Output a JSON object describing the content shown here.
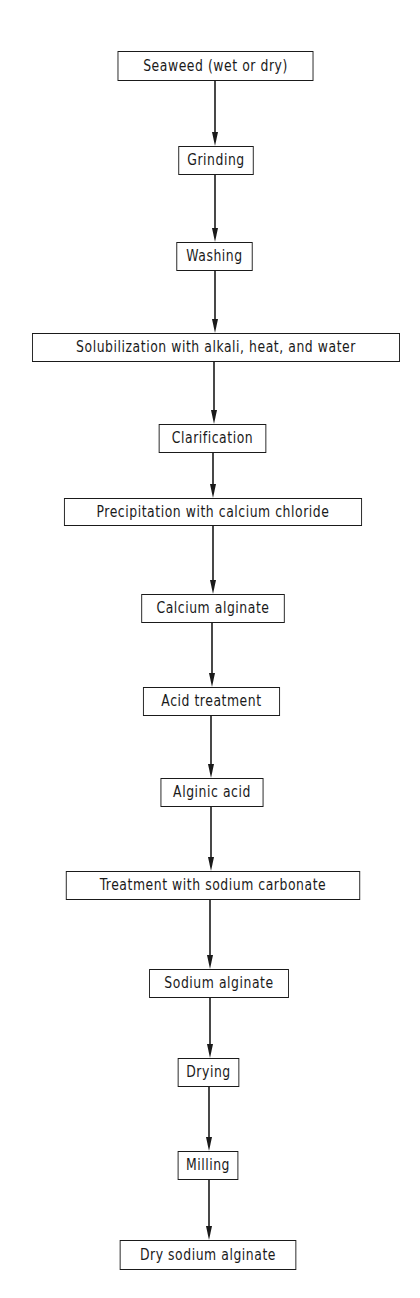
{
  "diagram": {
    "type": "flowchart",
    "direction": "top-to-bottom",
    "line_color": "#1a1a1a",
    "background": "#ffffff",
    "steps": [
      {
        "id": "seaweed",
        "label": "Seaweed (wet or dry)",
        "box": [
          109,
          51,
          213,
          30
        ]
      },
      {
        "id": "grinding",
        "label": "Grinding",
        "box": [
          175,
          146,
          82,
          29
        ]
      },
      {
        "id": "washing",
        "label": "Washing",
        "box": [
          173,
          242,
          83,
          29
        ]
      },
      {
        "id": "solubilization",
        "label": "Solubilization with alkali, heat, and water",
        "box": [
          16,
          333,
          400,
          29
        ]
      },
      {
        "id": "clarification",
        "label": "Clarification",
        "box": [
          154,
          424,
          117,
          29
        ]
      },
      {
        "id": "precipitation",
        "label": "Precipitation with calcium chloride",
        "box": [
          51,
          498,
          324,
          28
        ]
      },
      {
        "id": "calcium-alginate",
        "label": "Calcium alginate",
        "box": [
          135,
          594,
          156,
          29
        ]
      },
      {
        "id": "acid-treatment",
        "label": "Acid treatment",
        "box": [
          137,
          687,
          149,
          29
        ]
      },
      {
        "id": "alginic-acid",
        "label": "Alginic acid",
        "box": [
          156,
          778,
          112,
          29
        ]
      },
      {
        "id": "sodium-carbonate-treatment",
        "label": "Treatment with sodium carbonate",
        "box": [
          53,
          871,
          320,
          29
        ]
      },
      {
        "id": "sodium-alginate",
        "label": "Sodium alginate",
        "box": [
          143,
          969,
          152,
          29
        ]
      },
      {
        "id": "drying",
        "label": "Drying",
        "box": [
          175,
          1058,
          67,
          29
        ]
      },
      {
        "id": "milling",
        "label": "Milling",
        "box": [
          175,
          1151,
          66,
          29
        ]
      },
      {
        "id": "dry-sodium-alginate",
        "label": "Dry sodium alginate",
        "box": [
          112,
          1240,
          192,
          30
        ]
      }
    ],
    "arrows": [
      {
        "from": "seaweed",
        "to": "grinding",
        "x": 215
      },
      {
        "from": "grinding",
        "to": "washing",
        "x": 215
      },
      {
        "from": "washing",
        "to": "solubilization",
        "x": 215
      },
      {
        "from": "solubilization",
        "to": "clarification",
        "x": 214
      },
      {
        "from": "clarification",
        "to": "precipitation",
        "x": 213
      },
      {
        "from": "precipitation",
        "to": "calcium-alginate",
        "x": 213
      },
      {
        "from": "calcium-alginate",
        "to": "acid-treatment",
        "x": 212
      },
      {
        "from": "acid-treatment",
        "to": "alginic-acid",
        "x": 211
      },
      {
        "from": "alginic-acid",
        "to": "sodium-carbonate-treatment",
        "x": 211
      },
      {
        "from": "sodium-carbonate-treatment",
        "to": "sodium-alginate",
        "x": 210
      },
      {
        "from": "sodium-alginate",
        "to": "drying",
        "x": 210
      },
      {
        "from": "drying",
        "to": "milling",
        "x": 209
      },
      {
        "from": "milling",
        "to": "dry-sodium-alginate",
        "x": 209
      }
    ]
  }
}
